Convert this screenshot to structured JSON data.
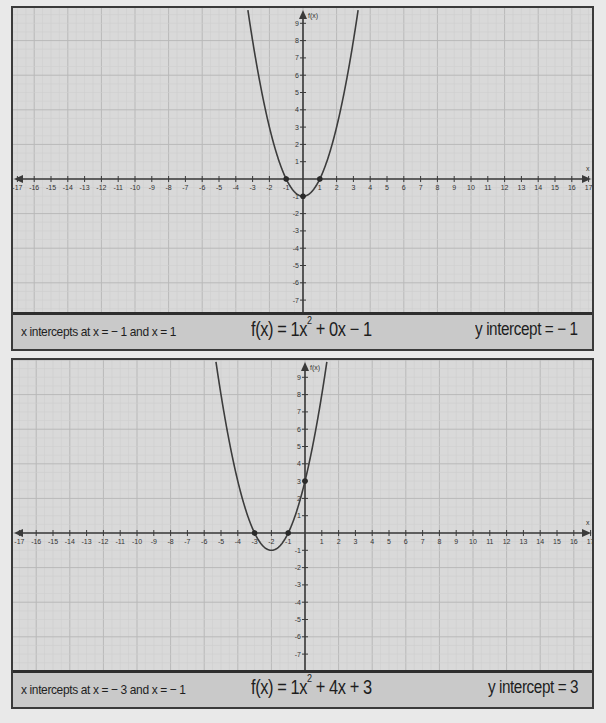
{
  "colors": {
    "page_background": "#e9e9e9",
    "plot_background": "#d9d9d9",
    "caption_background": "#c9c9c9",
    "grid_major": "#b9b9b9",
    "grid_minor": "#cecece",
    "axis": "#3a3a3a",
    "curve": "#3c3c3c",
    "border": "#333333"
  },
  "chart_data": [
    {
      "type": "line",
      "title": "f(x) = 1x^2 + 0x - 1",
      "function": {
        "a": 1,
        "b": 0,
        "c": -1
      },
      "xlabel": "x",
      "ylabel": "f(x)",
      "xlim": [
        -17,
        17
      ],
      "ylim": [
        -7,
        9
      ],
      "x_ticks": [
        -17,
        -16,
        -15,
        -14,
        -13,
        -12,
        -11,
        -10,
        -9,
        -8,
        -7,
        -6,
        -5,
        -4,
        -3,
        -2,
        -1,
        1,
        2,
        3,
        4,
        5,
        6,
        7,
        8,
        9,
        10,
        11,
        12,
        13,
        14,
        15,
        16,
        17
      ],
      "y_ticks": [
        -7,
        -6,
        -5,
        -4,
        -3,
        -2,
        -1,
        1,
        2,
        3,
        4,
        5,
        6,
        7,
        8,
        9
      ],
      "grid": true,
      "marked_points": [
        {
          "x": -1,
          "y": 0,
          "label": "x-intercept"
        },
        {
          "x": 1,
          "y": 0,
          "label": "x-intercept"
        },
        {
          "x": 0,
          "y": -1,
          "label": "y-intercept / vertex"
        }
      ],
      "annotations": {
        "x_intercepts": "x intercepts at x = − 1 and x = 1",
        "equation": "f(x) = 1x² + 0x − 1",
        "y_intercept": "y intercept = − 1"
      }
    },
    {
      "type": "line",
      "title": "f(x) = 1x^2 + 4x + 3",
      "function": {
        "a": 1,
        "b": 4,
        "c": 3
      },
      "xlabel": "x",
      "ylabel": "f(x)",
      "xlim": [
        -17,
        17
      ],
      "ylim": [
        -7,
        9
      ],
      "x_ticks": [
        -17,
        -16,
        -15,
        -14,
        -13,
        -12,
        -11,
        -10,
        -9,
        -8,
        -7,
        -6,
        -5,
        -4,
        -3,
        -2,
        -1,
        1,
        2,
        3,
        4,
        5,
        6,
        7,
        8,
        9,
        10,
        11,
        12,
        13,
        14,
        15,
        16,
        17
      ],
      "y_ticks": [
        -7,
        -6,
        -5,
        -4,
        -3,
        -2,
        -1,
        1,
        2,
        3,
        4,
        5,
        6,
        7,
        8,
        9
      ],
      "grid": true,
      "marked_points": [
        {
          "x": -3,
          "y": 0,
          "label": "x-intercept"
        },
        {
          "x": -1,
          "y": 0,
          "label": "x-intercept"
        },
        {
          "x": 0,
          "y": 3,
          "label": "y-intercept"
        }
      ],
      "annotations": {
        "x_intercepts": "x intercepts at x = − 3 and x = − 1",
        "equation": "f(x) = 1x² + 4x + 3",
        "y_intercept": "y intercept = 3"
      }
    }
  ],
  "panels": [
    {
      "caption": {
        "x_intercepts": "x intercepts at x = − 1 and x = 1",
        "equation_prefix": "f(x) = 1x",
        "equation_exp": "2",
        "equation_suffix": " + 0x − 1",
        "y_intercept": "y intercept = − 1"
      },
      "axis_labels": {
        "x": "x",
        "y": "f(x)"
      }
    },
    {
      "caption": {
        "x_intercepts": "x intercepts at x = − 3 and x = − 1",
        "equation_prefix": "f(x) = 1x",
        "equation_exp": "2",
        "equation_suffix": " + 4x + 3",
        "y_intercept": "y intercept = 3"
      },
      "axis_labels": {
        "x": "x",
        "y": "f(x)"
      }
    }
  ]
}
